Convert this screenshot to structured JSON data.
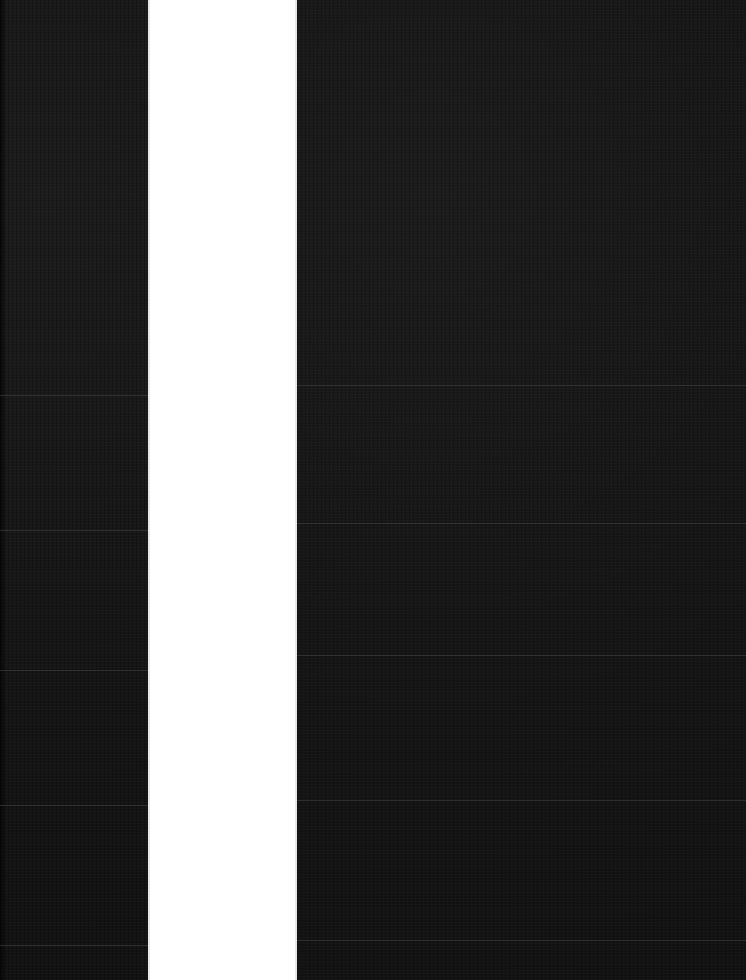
{
  "scene": {
    "description": "Dark textured surface divided by a vertical white strip",
    "colors": {
      "dark_surface": "#161616",
      "strip": "#ffffff",
      "scanline": "#464646"
    },
    "left_panel": {
      "x": 0,
      "width": 148,
      "lines_y": [
        395,
        530,
        670,
        805,
        945
      ]
    },
    "white_strip": {
      "x": 148,
      "width": 149
    },
    "right_panel": {
      "x": 297,
      "width": 449,
      "lines_y": [
        385,
        523,
        655,
        800,
        940
      ]
    }
  }
}
